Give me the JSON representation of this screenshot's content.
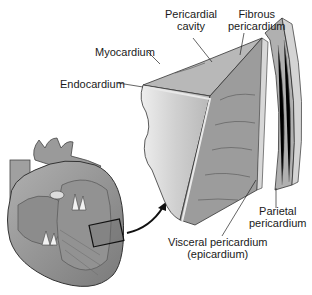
{
  "diagram": {
    "labels": {
      "myocardium": "Myocardium",
      "endocardium": "Endocardium",
      "pericardial_cavity_line1": "Pericardial",
      "pericardial_cavity_line2": "cavity",
      "fibrous_pericardium_line1": "Fibrous",
      "fibrous_pericardium_line2": "pericardium",
      "parietal_pericardium_line1": "Parietal",
      "parietal_pericardium_line2": "pericardium",
      "visceral_pericardium_line1": "Visceral pericardium",
      "visceral_pericardium_line2": "(epicardium)"
    },
    "colors": {
      "background": "#ffffff",
      "tissue_dark": "#8a8a8a",
      "tissue_mid": "#a8a8a8",
      "tissue_light": "#d8d8d8",
      "outline": "#333333",
      "arrow": "#111111"
    }
  }
}
